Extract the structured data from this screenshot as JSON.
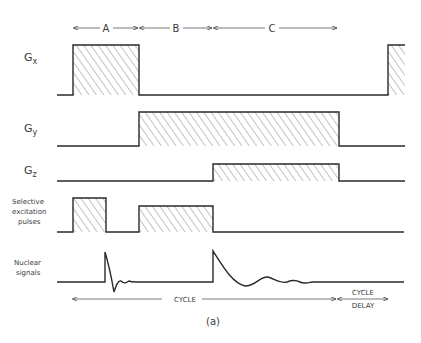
{
  "segments": [
    {
      "label": "A",
      "x1": 73,
      "x2": 139
    },
    {
      "label": "B",
      "x1": 139,
      "x2": 213
    },
    {
      "label": "C",
      "x1": 213,
      "x2": 337
    }
  ],
  "rows": [
    {
      "id": "gx",
      "label_main": "G",
      "label_sub": "x",
      "baseline": 95,
      "pulses": [
        {
          "x1": 73,
          "x2": 139,
          "top": 45
        },
        {
          "x1": 388,
          "x2": 405,
          "top": 45
        }
      ],
      "line_start": 57,
      "line_end": 388
    },
    {
      "id": "gy",
      "label_main": "G",
      "label_sub": "y",
      "baseline": 146,
      "pulses": [
        {
          "x1": 139,
          "x2": 339,
          "top": 112
        }
      ],
      "line_start": 57,
      "line_end": 405
    },
    {
      "id": "gz",
      "label_main": "G",
      "label_sub": "z",
      "baseline": 181,
      "pulses": [
        {
          "x1": 213,
          "x2": 339,
          "top": 164
        }
      ],
      "line_start": 57,
      "line_end": 405
    },
    {
      "id": "sel",
      "label_lines": [
        "Selective",
        "excitation",
        "pulses"
      ],
      "baseline": 232,
      "pulses": [
        {
          "x1": 73,
          "x2": 106,
          "top": 198
        },
        {
          "x1": 139,
          "x2": 213,
          "top": 206
        }
      ],
      "line_start": 57,
      "line_end": 404
    }
  ],
  "nuclear": {
    "label_lines": [
      "Nuclear",
      "signals"
    ],
    "baseline": 282
  },
  "bottom": {
    "cycle_label": "CYCLE",
    "cycle_delay_label_1": "CYCLE",
    "cycle_delay_label_2": "DELAY",
    "caption": "(a)"
  }
}
